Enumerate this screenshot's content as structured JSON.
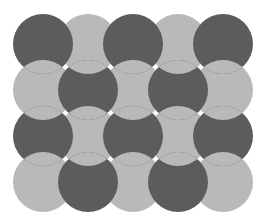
{
  "figure": {
    "title": "Woven circle grid illusion",
    "background": "#ffffff",
    "rows": 4,
    "cols": 5,
    "radius": 30,
    "col_centers": [
      43,
      88,
      133,
      178,
      223
    ],
    "row_centers": [
      44,
      90,
      136,
      182
    ],
    "colors": {
      "dark": "#5c5c5c",
      "light": "#b9b9b9"
    },
    "pattern": "checkerboard, dark where (row+col) is even",
    "stacking": "dark over horizontal light neighbors; light over vertical dark neighbors"
  }
}
